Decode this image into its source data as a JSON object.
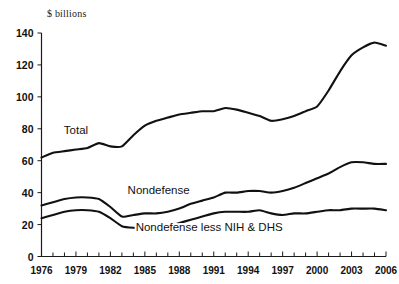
{
  "chart_data": {
    "type": "line",
    "title": "",
    "subtitle": "",
    "ylabel": "$ billions",
    "xlabel": "",
    "ylim": [
      0,
      140
    ],
    "xlim": [
      1976,
      2006
    ],
    "yticks": [
      0,
      20,
      40,
      60,
      80,
      100,
      120,
      140
    ],
    "xticks": [
      1976,
      1979,
      1982,
      1985,
      1988,
      1991,
      1994,
      1997,
      2000,
      2003,
      2006
    ],
    "x_minor_ticks_every": 1,
    "grid": false,
    "legend": "inline-labels",
    "legend_position": "inline",
    "x": [
      1976,
      1977,
      1978,
      1979,
      1980,
      1981,
      1982,
      1983,
      1984,
      1985,
      1986,
      1987,
      1988,
      1989,
      1990,
      1991,
      1992,
      1993,
      1994,
      1995,
      1996,
      1997,
      1998,
      1999,
      2000,
      2001,
      2002,
      2003,
      2004,
      2005,
      2006
    ],
    "series": [
      {
        "name": "Total",
        "color": "#111111",
        "label_x": 1979.0,
        "label_y": 77,
        "values": [
          62,
          65,
          66,
          67,
          68,
          71,
          69,
          69,
          76,
          82,
          85,
          87,
          89,
          90,
          91,
          91,
          93,
          92,
          90,
          88,
          85,
          86,
          88,
          91,
          94,
          104,
          116,
          126,
          131,
          134,
          132
        ]
      },
      {
        "name": "Nondefense",
        "color": "#111111",
        "label_x": 1986.2,
        "label_y": 39,
        "values": [
          32,
          34,
          36,
          37,
          37,
          36,
          31,
          25,
          26,
          27,
          27,
          28,
          30,
          33,
          35,
          37,
          40,
          40,
          41,
          41,
          40,
          41,
          43,
          46,
          49,
          52,
          56,
          59,
          59,
          58,
          58
        ]
      },
      {
        "name": "Nondefense less NIH & DHS",
        "color": "#111111",
        "label_x": 1990.6,
        "label_y": 16,
        "values": [
          24,
          26,
          28,
          29,
          29,
          28,
          24,
          19,
          18,
          18,
          19,
          19,
          21,
          23,
          25,
          27,
          28,
          28,
          28,
          29,
          27,
          26,
          27,
          27,
          28,
          29,
          29,
          30,
          30,
          30,
          29
        ]
      }
    ]
  },
  "axis": {
    "unit_label": "$ billions"
  }
}
